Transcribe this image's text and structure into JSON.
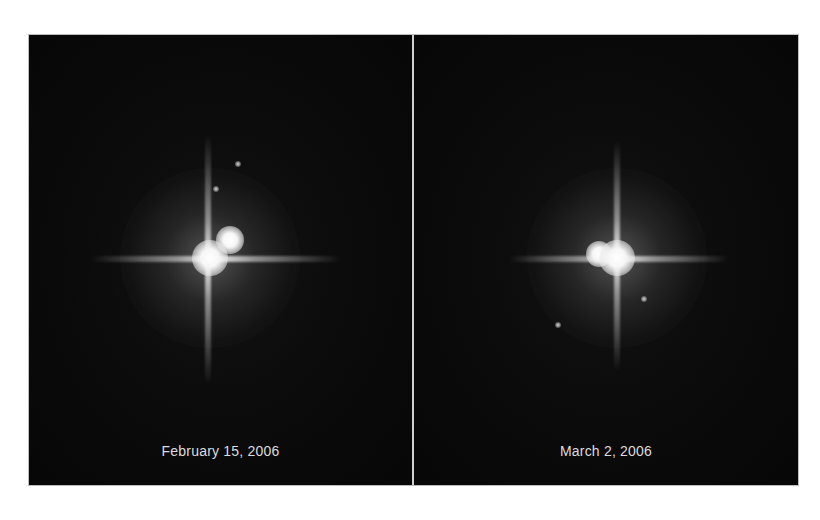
{
  "figure": {
    "colors": {
      "background": "#080808",
      "divider": "#cfcfcf",
      "caption": "#dcdcdc",
      "page": "#ffffff"
    },
    "panels": [
      {
        "caption": "February 15, 2006",
        "primary": {
          "x": 181,
          "y": 223
        },
        "companion": {
          "x": 201,
          "y": 205
        },
        "moons": [
          {
            "x": 209,
            "y": 129
          },
          {
            "x": 187,
            "y": 154
          }
        ]
      },
      {
        "caption": "March 2, 2006",
        "primary": {
          "x": 203,
          "y": 223
        },
        "companion": {
          "x": 185,
          "y": 218
        },
        "moons": [
          {
            "x": 230,
            "y": 264
          },
          {
            "x": 144,
            "y": 290
          }
        ]
      }
    ]
  }
}
